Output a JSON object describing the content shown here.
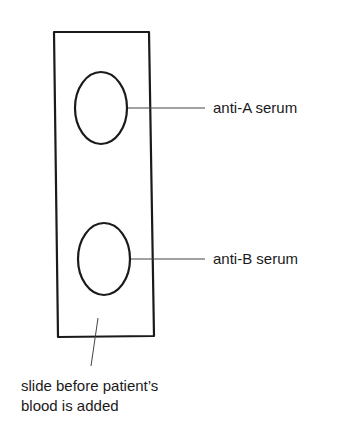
{
  "diagram": {
    "title": "",
    "slide": {
      "label": "slide before patient's blood is added"
    },
    "wells": [
      {
        "label": "anti-A serum"
      },
      {
        "label": "anti-B serum"
      }
    ],
    "caption": {
      "line1": "slide before patient’s",
      "line2": "blood is added"
    },
    "colors": {
      "stroke": "#1a1a1a",
      "background": "#ffffff"
    }
  }
}
